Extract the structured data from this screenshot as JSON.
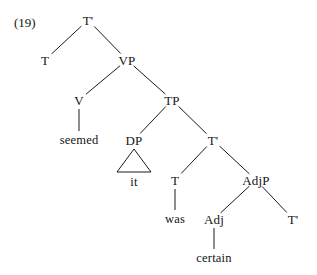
{
  "figure": {
    "example_number": "(19)",
    "width": 317,
    "height": 275,
    "background_color": "#ffffff",
    "ink_color": "#141414"
  },
  "tree": {
    "description": "Syntactic tree for raising construction 'seemed it was certain'",
    "nodes": [
      {
        "id": "n0",
        "label": "T'",
        "x": 88,
        "y": 20,
        "kind": "nonterminal"
      },
      {
        "id": "n1",
        "label": "T",
        "x": 45,
        "y": 60,
        "kind": "nonterminal"
      },
      {
        "id": "n2",
        "label": "VP",
        "x": 127,
        "y": 60,
        "kind": "nonterminal"
      },
      {
        "id": "n3",
        "label": "V",
        "x": 79,
        "y": 100,
        "kind": "nonterminal"
      },
      {
        "id": "n4",
        "label": "TP",
        "x": 172,
        "y": 100,
        "kind": "nonterminal"
      },
      {
        "id": "n5",
        "label": "seemed",
        "x": 79,
        "y": 140,
        "kind": "terminal"
      },
      {
        "id": "n6",
        "label": "DP",
        "x": 134,
        "y": 140,
        "kind": "nonterminal"
      },
      {
        "id": "n7",
        "label": "T'",
        "x": 213,
        "y": 140,
        "kind": "nonterminal"
      },
      {
        "id": "n8",
        "label": "it",
        "x": 134,
        "y": 182,
        "kind": "terminal"
      },
      {
        "id": "n9",
        "label": "T",
        "x": 175,
        "y": 180,
        "kind": "nonterminal"
      },
      {
        "id": "n10",
        "label": "AdjP",
        "x": 256,
        "y": 180,
        "kind": "nonterminal"
      },
      {
        "id": "n11",
        "label": "was",
        "x": 175,
        "y": 219,
        "kind": "terminal"
      },
      {
        "id": "n12",
        "label": "Adj",
        "x": 214,
        "y": 219,
        "kind": "nonterminal"
      },
      {
        "id": "n13",
        "label": "T'",
        "x": 293,
        "y": 219,
        "kind": "nonterminal"
      },
      {
        "id": "n14",
        "label": "certain",
        "x": 214,
        "y": 258,
        "kind": "terminal"
      }
    ],
    "edges": [
      {
        "from": "n0",
        "to": "n1"
      },
      {
        "from": "n0",
        "to": "n2"
      },
      {
        "from": "n2",
        "to": "n3"
      },
      {
        "from": "n2",
        "to": "n4"
      },
      {
        "from": "n3",
        "to": "n5"
      },
      {
        "from": "n4",
        "to": "n6"
      },
      {
        "from": "n4",
        "to": "n7"
      },
      {
        "from": "n7",
        "to": "n9"
      },
      {
        "from": "n7",
        "to": "n10"
      },
      {
        "from": "n9",
        "to": "n11"
      },
      {
        "from": "n10",
        "to": "n12"
      },
      {
        "from": "n10",
        "to": "n13"
      },
      {
        "from": "n12",
        "to": "n14"
      }
    ],
    "triangles": [
      {
        "parent": "n6",
        "child": "n8",
        "half_width": 17
      }
    ]
  }
}
